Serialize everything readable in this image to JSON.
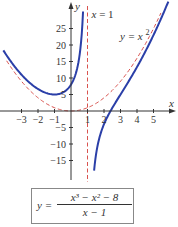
{
  "chart_data": {
    "type": "line",
    "title": "",
    "xlabel": "x",
    "ylabel": "y",
    "xlim": [
      -4.2,
      6.2
    ],
    "ylim": [
      -20,
      30
    ],
    "x_ticks": [
      -3,
      -2,
      -1,
      1,
      2,
      3,
      4,
      5
    ],
    "x_tick_labels": [
      "−3",
      "−2",
      "−1",
      "1",
      "2",
      "3",
      "4",
      "5"
    ],
    "y_ticks": [
      25,
      20,
      15,
      10,
      5,
      -5,
      -10,
      -15
    ],
    "y_tick_labels": [
      "25",
      "20",
      "15",
      "10",
      "5",
      "−5",
      "−10",
      "−15"
    ],
    "grid": false,
    "series": [
      {
        "name": "y = (x^3 - x^2 - 8)/(x - 1)",
        "style": "solid",
        "color": "#2b3fa8",
        "function": "(x^3 - x^2 - 8)/(x - 1)",
        "branches": [
          {
            "x": [
              -4.1,
              -3,
              -2,
              -1,
              0,
              0.5,
              0.73
            ],
            "y": [
              18.4,
              11,
              6.7,
              5,
              8,
              16.3,
              30
            ]
          },
          {
            "x": [
              1.4,
              2,
              2.5,
              3,
              4,
              5.5,
              5.9
            ],
            "y": [
              -18,
              -4,
              0.92,
              5,
              10.7,
              22.5,
              27.2
            ]
          }
        ]
      },
      {
        "name": "y = x^2",
        "style": "dashed",
        "color": "#d9534f",
        "function": "x^2",
        "x": [
          -3.9,
          -3,
          -2,
          -1,
          0,
          1,
          2,
          3,
          4,
          5,
          5.45
        ],
        "y": [
          15.2,
          9,
          4,
          1,
          0,
          1,
          4,
          9,
          16,
          25,
          29.7
        ]
      },
      {
        "name": "x = 1",
        "style": "dashed",
        "color": "#d9534f",
        "vertical_line_x": 1
      }
    ],
    "annotations": [
      {
        "text_lhs": "x",
        "text_rhs": "= 1",
        "near": "top of vertical asymptote"
      },
      {
        "text_lhs": "y",
        "text_rhs": "= x",
        "superscript": "2",
        "near": "upper right of parabola"
      }
    ],
    "formula": {
      "lhs": "y =",
      "numerator": "x³ − x² − 8",
      "denominator": "x − 1"
    }
  }
}
